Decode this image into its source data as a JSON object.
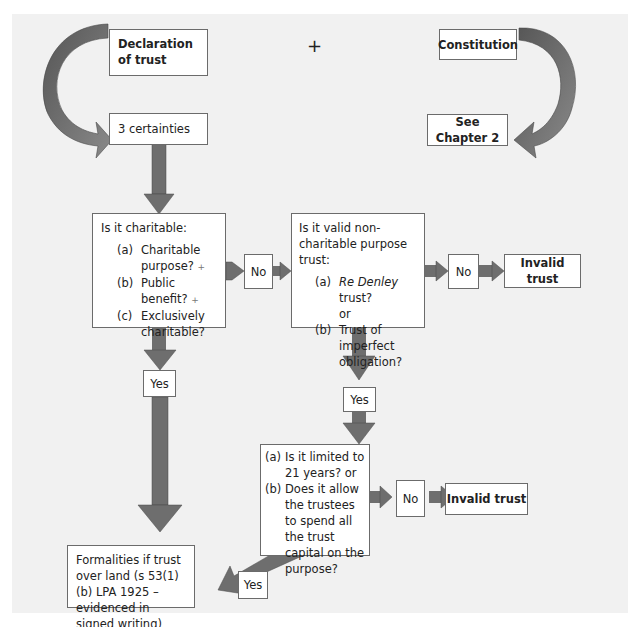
{
  "diagram": {
    "plus_symbol": "+",
    "nodes": {
      "declaration": "Declaration of trust",
      "constitution": "Constitution",
      "certainties": "3 certainties",
      "see_chapter": "See Chapter 2",
      "charitable": {
        "title": "Is it charitable:",
        "items": [
          {
            "key": "(a)",
            "text": "Charitable purpose?",
            "marker": "+"
          },
          {
            "key": "(b)",
            "text": "Public benefit?",
            "marker": "+"
          },
          {
            "key": "(c)",
            "text": "Exclusively charitable?",
            "marker": ""
          }
        ]
      },
      "non_charitable": {
        "title": "Is it valid non-charitable purpose trust:",
        "items": [
          {
            "key": "(a)",
            "text_italic": "Re Denley",
            "text": " trust?"
          },
          {
            "key": "",
            "text": "or"
          },
          {
            "key": "(b)",
            "text": "Trust of imperfect obligation?"
          }
        ]
      },
      "limited": {
        "items": [
          {
            "key": "(a)",
            "text": "Is it limited to 21 years? or"
          },
          {
            "key": "(b)",
            "text": "Does it allow the trustees to spend all the trust capital on the purpose?"
          }
        ]
      },
      "invalid_1": "Invalid trust",
      "invalid_2": "Invalid trust",
      "formalities": "Formalities if trust over land (s 53(1)(b) LPA 1925 – evidenced in signed writing)"
    },
    "labels": {
      "no_1": "No",
      "no_2": "No",
      "no_3": "No",
      "yes_1": "Yes",
      "yes_2": "Yes",
      "yes_3": "Yes"
    },
    "colors": {
      "arrow_fill": "#6e6e6e",
      "arrow_stroke": "#4a4a4a",
      "panel": "#f1f1f1",
      "box_border": "#6b6b6b"
    }
  }
}
